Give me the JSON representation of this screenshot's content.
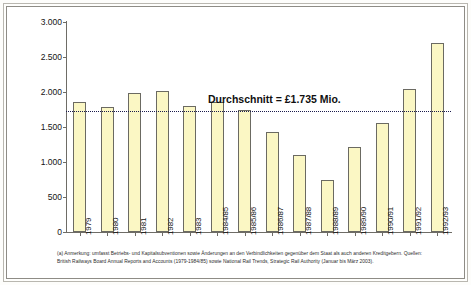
{
  "axis": {
    "ylabel": "Staatliche Unterstützung (Subventionen plus Kredite)",
    "yticks": [
      "0",
      "500",
      "1.000",
      "1.500",
      "2.000",
      "2.500",
      "3.000"
    ]
  },
  "average": {
    "label": "Durchschnitt = £1.735 Mio."
  },
  "footnote": {
    "text": "(a) Anmerkung: umfasst Betriebs- und Kapitalsubventionen sowie Änderungen an den Verbindlichkeiten gegenüber dem Staat als auch anderen Kreditgebern. Quellen: British Railways Board Annual Reports and Accounts (1979-1984/85) sowie National Rail Trends, Strategic Rail Authority (Januar bis März 2003)."
  },
  "colors": {
    "bar_fill": "#fbf7c4",
    "bar_stroke": "#6b6a62",
    "avg_line": "#1b1b4d",
    "axis": "#6e6c66"
  },
  "chart_data": {
    "type": "bar",
    "title": "",
    "xlabel": "",
    "ylabel": "Staatliche Unterstützung (Subventionen plus Kredite)",
    "ylim": [
      0,
      3000
    ],
    "ytick_values": [
      0,
      500,
      1000,
      1500,
      2000,
      2500,
      3000
    ],
    "grid": false,
    "legend": "none",
    "categories": [
      "1979",
      "1980",
      "1981",
      "1982",
      "1983",
      "1984/85",
      "1985/86",
      "1986/87",
      "1987/88",
      "1988/89",
      "1989/90",
      "1990/91",
      "1991/92",
      "1992/93"
    ],
    "values": [
      1860,
      1790,
      1990,
      2020,
      1800,
      1860,
      1740,
      1430,
      1100,
      740,
      1220,
      1560,
      2050,
      2700
    ],
    "annotations": [
      {
        "type": "hline",
        "value": 1735,
        "label": "Durchschnitt = £1.735 Mio.",
        "style": "dotted"
      }
    ],
    "units": "Mio. £"
  }
}
